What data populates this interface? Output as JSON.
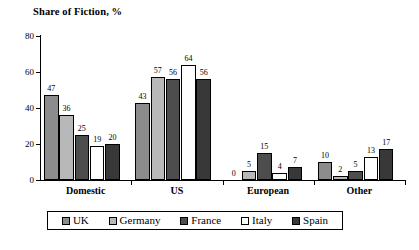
{
  "chart_data": {
    "type": "bar",
    "title": "Share of Fiction, %",
    "xlabel": "",
    "ylabel": "",
    "ylim": [
      0,
      80
    ],
    "yticks": [
      0,
      20,
      40,
      60,
      80
    ],
    "grid": false,
    "legend_position": "bottom",
    "categories": [
      "Domestic",
      "US",
      "European",
      "Other"
    ],
    "series": [
      {
        "name": "UK",
        "color": "#8c8c8c",
        "values": [
          47,
          43,
          0,
          10
        ]
      },
      {
        "name": "Germany",
        "color": "#b8b8b8",
        "values": [
          36,
          57,
          5,
          2
        ]
      },
      {
        "name": "France",
        "color": "#4d4d4d",
        "values": [
          25,
          56,
          15,
          5
        ]
      },
      {
        "name": "Italy",
        "color": "#ffffff",
        "values": [
          19,
          64,
          4,
          13
        ]
      },
      {
        "name": "Spain",
        "color": "#383838",
        "values": [
          20,
          56,
          7,
          17
        ]
      }
    ]
  }
}
